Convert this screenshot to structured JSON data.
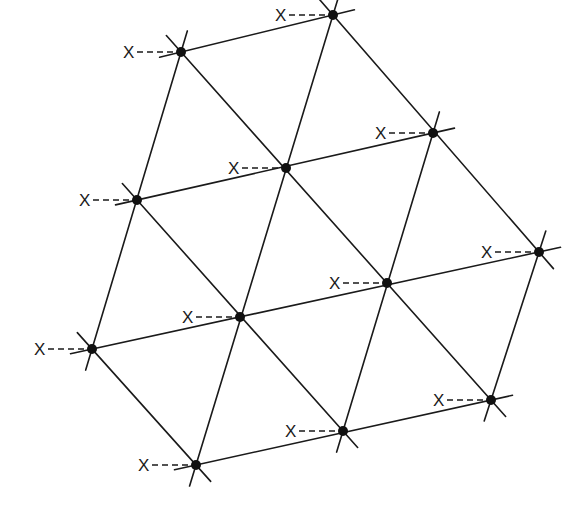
{
  "diagram": {
    "marker_label": "X",
    "colors": {
      "line": "#1a1a1a",
      "node": "#111111",
      "background": "#ffffff"
    },
    "nodes": [
      {
        "id": "A",
        "label": "X"
      },
      {
        "id": "B",
        "label": "X"
      },
      {
        "id": "C",
        "label": "X"
      },
      {
        "id": "D",
        "label": "X"
      },
      {
        "id": "E",
        "label": "X"
      },
      {
        "id": "F",
        "label": "X"
      },
      {
        "id": "G",
        "label": "X"
      },
      {
        "id": "H",
        "label": "X"
      },
      {
        "id": "I",
        "label": "X"
      },
      {
        "id": "J",
        "label": "X"
      },
      {
        "id": "K",
        "label": "X"
      },
      {
        "id": "L",
        "label": "X"
      }
    ],
    "line_families": [
      {
        "name": "rows",
        "members": [
          [
            "A",
            "B"
          ],
          [
            "C",
            "D",
            "E"
          ],
          [
            "F",
            "G",
            "H",
            "I"
          ],
          [
            "J",
            "K",
            "L"
          ]
        ]
      },
      {
        "name": "steep",
        "members": [
          [
            "F",
            "C",
            "A"
          ],
          [
            "J",
            "G",
            "D",
            "B"
          ],
          [
            "K",
            "H",
            "E"
          ],
          [
            "L",
            "I"
          ]
        ]
      },
      {
        "name": "diagonal",
        "members": [
          [
            "A",
            "D",
            "H",
            "L"
          ],
          [
            "C",
            "G",
            "K"
          ],
          [
            "F",
            "J"
          ],
          [
            "B",
            "E",
            "I"
          ]
        ]
      }
    ]
  }
}
